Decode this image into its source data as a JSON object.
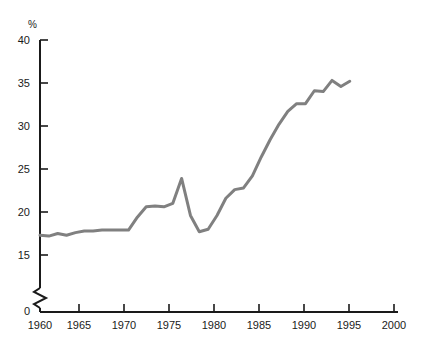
{
  "chart_data": {
    "type": "line",
    "title": "",
    "subtitle": "",
    "xlabel": "",
    "ylabel": "%",
    "unit_label": "%",
    "xlim": [
      1960,
      2000
    ],
    "ylim": [
      0,
      40
    ],
    "y_axis_break": true,
    "y_axis_break_between": [
      0,
      15
    ],
    "grid": false,
    "legend": null,
    "line_color": "#808080",
    "axis_color": "#1a1a1a",
    "yticks": [
      0,
      15,
      20,
      25,
      30,
      35,
      40
    ],
    "ytick_labels": [
      "0",
      "15",
      "20",
      "25",
      "30",
      "35",
      "40"
    ],
    "xticks": [
      1960,
      1965,
      1970,
      1975,
      1980,
      1985,
      1990,
      1995,
      2000
    ],
    "xtick_labels": [
      "1960",
      "1965",
      "1970",
      "1975",
      "1980",
      "1985",
      "1990",
      "1995",
      "2000"
    ],
    "series": [
      {
        "name": "share",
        "x": [
          1960,
          1961,
          1962,
          1963,
          1964,
          1965,
          1966,
          1967,
          1968,
          1969,
          1970,
          1971,
          1972,
          1973,
          1974,
          1975,
          1976,
          1977,
          1978,
          1979,
          1980,
          1981,
          1982,
          1983,
          1984,
          1985,
          1986,
          1987,
          1988,
          1989,
          1990,
          1991,
          1992,
          1993,
          1994,
          1995
        ],
        "values": [
          17.3,
          17.2,
          17.5,
          17.3,
          17.6,
          17.8,
          17.8,
          17.9,
          17.9,
          17.9,
          17.9,
          19.4,
          20.6,
          20.7,
          20.6,
          21.0,
          23.9,
          19.6,
          17.7,
          18.0,
          19.6,
          21.6,
          22.6,
          22.8,
          24.2,
          26.4,
          28.4,
          30.2,
          31.7,
          32.6,
          32.6,
          34.1,
          34.0,
          35.3,
          34.6,
          35.2
        ]
      }
    ]
  },
  "axis": {
    "y_unit": "%",
    "y_tick_0": "0",
    "y_tick_15": "15",
    "y_tick_20": "20",
    "y_tick_25": "25",
    "y_tick_30": "30",
    "y_tick_35": "35",
    "y_tick_40": "40",
    "x_tick_1960": "1960",
    "x_tick_1965": "1965",
    "x_tick_1970": "1970",
    "x_tick_1975": "1975",
    "x_tick_1980": "1980",
    "x_tick_1985": "1985",
    "x_tick_1990": "1990",
    "x_tick_1995": "1995",
    "x_tick_2000": "2000"
  }
}
